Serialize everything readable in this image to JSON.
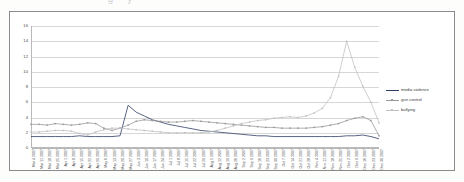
{
  "ghost_title_fragment": "g    y",
  "legend": {
    "position": "right",
    "entries": [
      {
        "label": "media violence",
        "color": "#2d3d66",
        "marker": false
      },
      {
        "label": "gun control",
        "color": "#9a9a9a",
        "marker": true
      },
      {
        "label": "bullying",
        "color": "#c2c2c2",
        "marker": true
      }
    ]
  },
  "chart_data": {
    "type": "line",
    "title": "",
    "xlabel": "",
    "ylabel": "",
    "ylim": [
      0,
      16
    ],
    "yticks": [
      0,
      2,
      4,
      6,
      8,
      10,
      12,
      14,
      16
    ],
    "grid": true,
    "categories": [
      "Mar 4 2007",
      "Mar 11 2007",
      "Mar 18 2007",
      "Mar 25 2007",
      "Apr 1 2007",
      "Apr 8 2007",
      "Apr 15 2007",
      "Apr 22 2007",
      "Apr 29 2007",
      "May 6 2007",
      "May 13 2007",
      "May 20 2007",
      "May 27 2007",
      "Jun 3 2007",
      "Jun 10 2007",
      "Jun 17 2007",
      "Jun 24 2007",
      "Jul 1 2007",
      "Jul 8 2007",
      "Jul 15 2007",
      "Jul 22 2007",
      "Jul 29 2007",
      "Aug 5 2007",
      "Aug 12 2007",
      "Aug 19 2007",
      "Aug 26 2007",
      "Sep 2 2007",
      "Sep 9 2007",
      "Sep 16 2007",
      "Sep 23 2007",
      "Sep 30 2007",
      "Oct 7 2007",
      "Oct 14 2007",
      "Oct 21 2007",
      "Oct 28 2007",
      "Nov 4 2007",
      "Nov 11 2007",
      "Nov 18 2007",
      "Nov 25 2007",
      "Dec 2 2007",
      "Dec 9 2007",
      "Dec 16 2007",
      "Dec 23 2007",
      "Dec 30 2007"
    ],
    "series": [
      {
        "name": "media violence",
        "color": "#2d3d66",
        "values": [
          1.5,
          1.5,
          1.5,
          1.5,
          1.5,
          1.5,
          1.6,
          1.5,
          1.5,
          1.5,
          1.5,
          1.6,
          5.6,
          4.7,
          4.2,
          3.7,
          3.4,
          3.1,
          2.9,
          2.7,
          2.5,
          2.3,
          2.2,
          2.1,
          2.0,
          1.9,
          1.8,
          1.7,
          1.6,
          1.6,
          1.5,
          1.5,
          1.5,
          1.5,
          1.5,
          1.5,
          1.5,
          1.5,
          1.5,
          1.6,
          1.6,
          1.7,
          1.5,
          1.2
        ]
      },
      {
        "name": "gun control",
        "color": "#9a9a9a",
        "values": [
          3.1,
          3.1,
          3.0,
          3.2,
          3.1,
          3.0,
          3.1,
          3.3,
          3.2,
          2.6,
          2.3,
          2.6,
          3.0,
          3.5,
          3.7,
          3.6,
          3.5,
          3.4,
          3.4,
          3.5,
          3.6,
          3.5,
          3.4,
          3.3,
          3.2,
          3.1,
          3.0,
          2.9,
          2.8,
          2.7,
          2.7,
          2.6,
          2.6,
          2.6,
          2.6,
          2.7,
          2.8,
          3.0,
          3.2,
          3.6,
          3.9,
          4.1,
          3.6,
          1.6
        ]
      },
      {
        "name": "bullying",
        "color": "#c2c2c2",
        "values": [
          2.1,
          2.1,
          2.2,
          2.3,
          2.3,
          2.2,
          1.9,
          1.7,
          2.1,
          2.4,
          2.6,
          2.6,
          2.5,
          2.4,
          2.3,
          2.2,
          2.1,
          2.0,
          2.0,
          2.0,
          2.0,
          2.0,
          2.1,
          2.3,
          2.6,
          2.9,
          3.2,
          3.4,
          3.6,
          3.7,
          3.9,
          4.0,
          4.1,
          4.0,
          4.2,
          4.6,
          5.2,
          6.6,
          9.4,
          14.0,
          10.6,
          8.1,
          6.0,
          3.3
        ]
      }
    ]
  }
}
